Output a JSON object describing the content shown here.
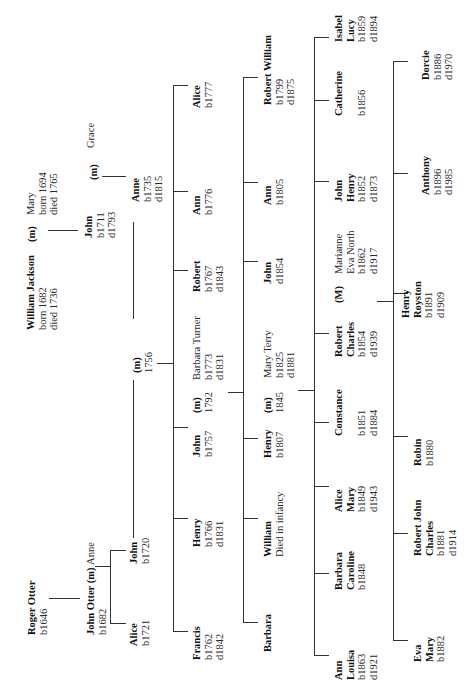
{
  "orientation": "rotated 90 degrees counter-clockwise (text reads bottom-to-top)",
  "generations": [
    {
      "people": [
        {
          "id": "roger",
          "name": "Roger Otter",
          "lines": [
            "b1646"
          ]
        },
        {
          "id": "william",
          "name": "William Jackson",
          "lines": [
            "born 1682",
            "died 1736"
          ]
        },
        {
          "id": "mary1",
          "name": "Mary",
          "lines": [
            "born 1694",
            "died 1765"
          ],
          "spouse_label": "(m)"
        }
      ]
    }
  ],
  "nodes": {
    "roger": {
      "name": "Roger Otter",
      "l1": "b1646"
    },
    "john_otter": {
      "name": "John Otter (m)",
      "spouse": "Anne",
      "l1": "b1682"
    },
    "william": {
      "name": "William Jackson",
      "l1": "born 1682",
      "l2": "died 1736"
    },
    "m_wj": "(m)",
    "mary1": {
      "name": "Mary",
      "l1": "born 1694",
      "l2": "died 1765"
    },
    "alice1721": {
      "name": "Alice",
      "l1": "b1721"
    },
    "john1720": {
      "name": "John",
      "l1": "b1720"
    },
    "john1711": {
      "name": "John",
      "l1": "b1711",
      "l2": "d1793"
    },
    "m_jg": "(m)",
    "grace": {
      "name": "Grace"
    },
    "anne1735": {
      "name": "Anne",
      "l1": "b1735",
      "l2": "d1815"
    },
    "m1756": {
      "l0": "(m)",
      "l1": "1756"
    },
    "francis": {
      "name": "Francis",
      "l1": "b1762",
      "l2": "d1842"
    },
    "henry1766": {
      "name": "Henry",
      "l1": "b1766",
      "l2": "d1831"
    },
    "john1757": {
      "name": "John",
      "l1": "b1757"
    },
    "m1792": {
      "l0": "(m)",
      "l1": "1792"
    },
    "barbara_turner": {
      "name": "Barbara Turner",
      "l1": "b1773",
      "l2": "d1831"
    },
    "robert1767": {
      "name": "Robert",
      "l1": "b1767",
      "l2": "d1843"
    },
    "ann1776": {
      "name": "Ann",
      "l1": "b1776"
    },
    "alice1777": {
      "name": "Alice",
      "l1": "b1777"
    },
    "barbara": {
      "name": "Barbara"
    },
    "william_inf": {
      "name": "William",
      "l1": "Died in infancy"
    },
    "henry1807": {
      "name": "Henry",
      "l1": "b1807"
    },
    "m1845": {
      "l0": "(m)",
      "l1": "1845"
    },
    "mary_terry": {
      "name": "Mary Terry",
      "l1": "b1825",
      "l2": "d1881"
    },
    "john1854": {
      "name": "John",
      "l1": "d1854"
    },
    "ann1805": {
      "name": "Ann",
      "l1": "b1805"
    },
    "robert_william": {
      "name": "Robert William",
      "l1": "b1799",
      "l2": "d1875"
    },
    "ann_louisa": {
      "name1": "Ann",
      "name2": "Louisa",
      "l1": "b1863",
      "l2": "d1921"
    },
    "barbara_caroline": {
      "name1": "Barbara",
      "name2": "Caroline",
      "l1": "b1848"
    },
    "alice_mary": {
      "name1": "Alice",
      "name2": "Mary",
      "l1": "b1849",
      "l2": "d1943"
    },
    "constance": {
      "name": "Constance",
      "l1": "b1851",
      "l2": "d1884"
    },
    "robert_charles": {
      "name1": "Robert",
      "name2": "Charles",
      "l1": "b1854",
      "l2": "d1939"
    },
    "m_capital": "(M)",
    "marianne": {
      "name1": "Marianne",
      "name2": "Eva North",
      "l1": "b1862",
      "l2": "d1917"
    },
    "john_henry": {
      "name1": "John",
      "name2": "Henry",
      "l1": "b1852",
      "l2": "d1873"
    },
    "catherine": {
      "name": "Catherine",
      "l1": "b1856"
    },
    "isabel_lucy": {
      "name1": "Isabel",
      "name2": "Lucy",
      "l1": "b1859",
      "l2": "d1894"
    },
    "eva_mary": {
      "name1": "Eva",
      "name2": "Mary",
      "l1": "b1882"
    },
    "robert_john_charles": {
      "name1": "Robert John",
      "name2": "Charles",
      "l1": "b1881",
      "l2": "d1914"
    },
    "robin": {
      "name": "Robin",
      "l1": "b1880"
    },
    "henry_royston": {
      "name1": "Henry",
      "name2": "Royston",
      "l1": "b1891",
      "l2": "d1909"
    },
    "anthony": {
      "name": "Anthony",
      "l1": "b1896",
      "l2": "d1985"
    },
    "dorcie": {
      "name": "Dorcie",
      "l1": "b1886",
      "l2": "d1970"
    }
  }
}
